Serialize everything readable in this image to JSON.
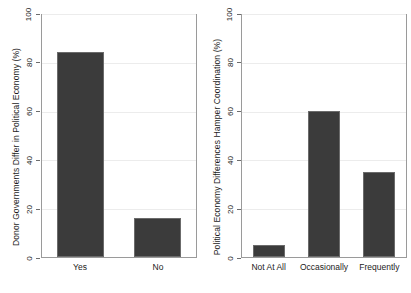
{
  "chart_data": [
    {
      "type": "bar",
      "panel": "left",
      "title": "",
      "xlabel": "",
      "ylabel": "Donor Governments Differ in Political Economy (%)",
      "categories": [
        "Yes",
        "No"
      ],
      "values": [
        84,
        16
      ],
      "ylim": [
        0,
        100
      ],
      "yticks": [
        0,
        20,
        40,
        60,
        80,
        100
      ],
      "ytick_labels": [
        "0",
        "20",
        "40",
        "60",
        "80",
        "100"
      ],
      "grid": true,
      "legend": "none",
      "bar_color": "#3b3b3b"
    },
    {
      "type": "bar",
      "panel": "right",
      "title": "",
      "xlabel": "",
      "ylabel": "Political Economy Differences Hamper Coordination (%)",
      "categories": [
        "Not At All",
        "Occasionally",
        "Frequently"
      ],
      "values": [
        5,
        60,
        35
      ],
      "ylim": [
        0,
        100
      ],
      "yticks": [
        0,
        20,
        40,
        60,
        80,
        100
      ],
      "ytick_labels": [
        "0",
        "20",
        "40",
        "60",
        "80",
        "100"
      ],
      "grid": true,
      "legend": "none",
      "bar_color": "#3b3b3b"
    }
  ]
}
